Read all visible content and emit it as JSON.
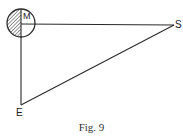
{
  "figure": {
    "caption": "Fig. 9",
    "labels": {
      "moon": "M",
      "sun": "S",
      "earth": "E"
    },
    "colors": {
      "line": "#2a2a2a",
      "hatch": "#555555",
      "background": "#ffffff"
    },
    "geometry": {
      "moon_center": [
        21,
        23
      ],
      "moon_radius": 14,
      "sun_point": [
        174,
        25
      ],
      "earth_point": [
        21,
        105
      ],
      "shaded_half": "left"
    }
  }
}
